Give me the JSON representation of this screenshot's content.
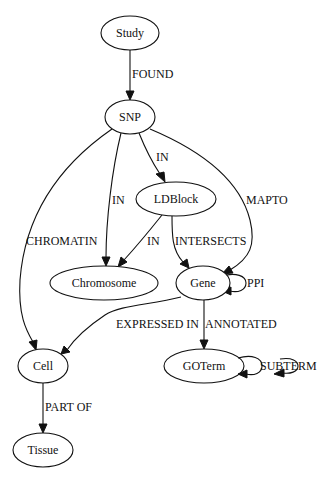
{
  "diagram": {
    "type": "directed-graph",
    "nodes": {
      "study": {
        "label": "Study"
      },
      "snp": {
        "label": "SNP"
      },
      "ldblock": {
        "label": "LDBlock"
      },
      "chromosome": {
        "label": "Chromosome"
      },
      "gene": {
        "label": "Gene"
      },
      "cell": {
        "label": "Cell"
      },
      "goterm": {
        "label": "GOTerm"
      },
      "tissue": {
        "label": "Tissue"
      }
    },
    "edges": {
      "study_snp": {
        "from": "Study",
        "to": "SNP",
        "label": "FOUND"
      },
      "snp_ldblock": {
        "from": "SNP",
        "to": "LDBlock",
        "label": "IN"
      },
      "snp_chromosome": {
        "from": "SNP",
        "to": "Chromosome",
        "label": "IN"
      },
      "snp_gene": {
        "from": "SNP",
        "to": "Gene",
        "label": "MAPTO"
      },
      "snp_cell": {
        "from": "SNP",
        "to": "Cell",
        "label": "CHROMATIN"
      },
      "ldblock_chromosome": {
        "from": "LDBlock",
        "to": "Chromosome",
        "label": "IN"
      },
      "ldblock_gene": {
        "from": "LDBlock",
        "to": "Gene",
        "label": "INTERSECTS"
      },
      "gene_gene": {
        "from": "Gene",
        "to": "Gene",
        "label": "PPI"
      },
      "gene_cell": {
        "from": "Gene",
        "to": "Cell",
        "label": "EXPRESSED IN"
      },
      "gene_goterm": {
        "from": "Gene",
        "to": "GOTerm",
        "label": "ANNOTATED"
      },
      "goterm_goterm": {
        "from": "GOTerm",
        "to": "GOTerm",
        "label": "SUBTERM"
      },
      "cell_tissue": {
        "from": "Cell",
        "to": "Tissue",
        "label": "PART OF"
      }
    }
  }
}
